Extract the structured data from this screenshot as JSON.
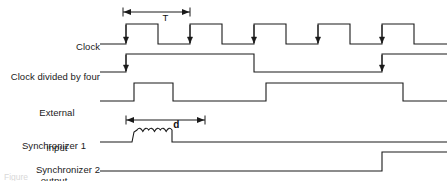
{
  "figure": {
    "kind": "timing-diagram",
    "width": 447,
    "height": 181,
    "background_color": "#ffffff",
    "trace_color": "#1a1a1a",
    "caption_fragment": "Figure"
  },
  "labels": {
    "clock": "Clock",
    "clock_divided": "Clock divided by four",
    "external_input_line1": "External",
    "external_input_line2": "input",
    "sync1_line1": "Synchronizer 1",
    "sync1_line2": "output",
    "sync2": "Synchronizer 2"
  },
  "annotations": {
    "period_label": "T",
    "delay_label": "d"
  },
  "chart_data": {
    "type": "line",
    "xlabel": "",
    "ylabel": "",
    "xlim": [
      100,
      447
    ],
    "grid": false,
    "legend": "none",
    "time_axis": {
      "clock_period_px": 64,
      "first_rising_edge_px": 126,
      "rising_edges_px": [
        126,
        190,
        254,
        318,
        382
      ]
    },
    "measurements": [
      {
        "name": "clock-period",
        "label": "T",
        "x_start": 123,
        "x_end": 190,
        "y": 12,
        "row": "clock"
      },
      {
        "name": "synchronizer-delay",
        "label": "d",
        "x_start": 126,
        "x_end": 205,
        "y": 120,
        "row": "synchronizer-1-output"
      }
    ],
    "series": [
      {
        "name": "Clock",
        "row_index": 0,
        "y_high": 24,
        "y_low": 44,
        "start_level": "low",
        "transitions_px": [
          126,
          158,
          190,
          222,
          254,
          286,
          318,
          350,
          382,
          414
        ],
        "edge_markers_px": [
          126,
          190,
          254,
          318,
          382
        ],
        "edge_marker_kind": "down-arrow-on-rising-edge"
      },
      {
        "name": "Clock divided by four",
        "row_index": 1,
        "y_high": 54,
        "y_low": 72,
        "start_level": "low",
        "transitions_px": [
          126,
          254,
          382
        ],
        "edge_markers_px": [
          126,
          382
        ],
        "edge_marker_kind": "down-arrow-on-rising-edge"
      },
      {
        "name": "External input",
        "row_index": 2,
        "y_high": 83,
        "y_low": 101,
        "start_level": "low",
        "transitions_px": [
          134,
          173,
          266,
          403
        ],
        "edge_markers_px": [],
        "edge_marker_kind": "none"
      },
      {
        "name": "Synchronizer 1 output",
        "row_index": 3,
        "y_high": 130,
        "y_low": 142,
        "start_level": "low",
        "transitions_px": [
          134,
          172
        ],
        "metastable": {
          "present": true,
          "x_start": 134,
          "x_end": 172,
          "humps": 3,
          "amplitude_px": 4
        },
        "edge_markers_px": [],
        "edge_marker_kind": "none"
      },
      {
        "name": "Synchronizer 2",
        "row_index": 4,
        "y_high": 152,
        "y_low": 171,
        "start_level": "low",
        "transitions_px": [
          382
        ],
        "edge_markers_px": [],
        "edge_marker_kind": "none"
      }
    ]
  }
}
